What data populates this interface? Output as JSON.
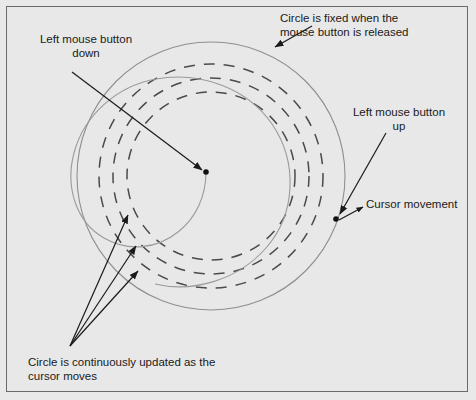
{
  "figure": {
    "background_color": "#e8e8e8",
    "border_color": "#6a6a6a",
    "ink_color": "#1a1a1a",
    "curve_color": "#8c8c8c",
    "dash_color": "#555555"
  },
  "annotations": {
    "circle_fixed": "Circle is fixed when the\nmouse button is released",
    "mouse_down": "Left mouse button\ndown",
    "mouse_up": "Left mouse button\nup",
    "cursor_movement": "Cursor movement",
    "continuously_updated": "Circle is continuously updated as the\ncursor moves"
  },
  "diagram_data": {
    "type": "diagram",
    "center_point": {
      "x": 206,
      "y": 172,
      "label": "mouse-down anchor"
    },
    "cursor_point": {
      "x": 336,
      "y": 219,
      "label": "mouse-up / cursor position"
    },
    "final_circle": {
      "cx": 211,
      "cy": 176,
      "r": 134,
      "style": "solid"
    },
    "intermediate_circles": [
      {
        "cx": 211,
        "cy": 176,
        "r": 112,
        "style": "dashed"
      },
      {
        "cx": 211,
        "cy": 176,
        "r": 98,
        "style": "dashed"
      },
      {
        "cx": 211,
        "cy": 176,
        "r": 84,
        "style": "dashed"
      }
    ],
    "spiral": {
      "from": "center_point",
      "to": "cursor_point",
      "style": "solid"
    },
    "leader_lines": [
      {
        "name": "mouse-down-leader",
        "from": [
          72,
          72
        ],
        "to": [
          204,
          171
        ]
      },
      {
        "name": "circle-fixed-leader",
        "from": [
          310,
          26
        ],
        "to": [
          273,
          47
        ]
      },
      {
        "name": "mouse-up-leader",
        "from": [
          385,
          132
        ],
        "to": [
          339,
          215
        ]
      },
      {
        "name": "cursor-leader",
        "from": [
          341,
          219
        ],
        "to": [
          364,
          206
        ]
      },
      {
        "name": "updated-leader-1",
        "from": [
          70,
          346
        ],
        "to": [
          129,
          212
        ]
      },
      {
        "name": "updated-leader-2",
        "from": [
          70,
          346
        ],
        "to": [
          137,
          243
        ]
      },
      {
        "name": "updated-leader-3",
        "from": [
          70,
          346
        ],
        "to": [
          139,
          268
        ]
      }
    ]
  }
}
